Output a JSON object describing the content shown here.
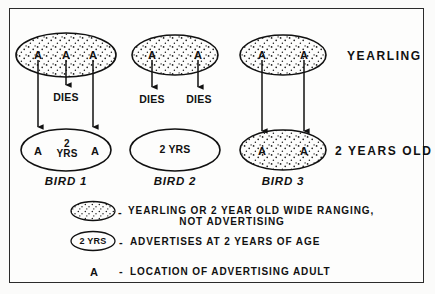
{
  "figure": {
    "row_labels": {
      "top": "YEARLING",
      "bottom": "2 YEARS OLD"
    },
    "birds": [
      {
        "caption": "BIRD 1",
        "top": {
          "stippled": true,
          "markers": [
            "A",
            "A",
            "A"
          ]
        },
        "bottom": {
          "stippled": false,
          "left_marker": "A",
          "center_line1": "2",
          "center_line2": "YRS",
          "right_marker": "A"
        },
        "dies_labels": [
          "DIES"
        ]
      },
      {
        "caption": "BIRD 2",
        "top": {
          "stippled": true,
          "markers": [
            "A",
            "A"
          ]
        },
        "bottom": {
          "stippled": false,
          "center_text": "2 YRS"
        },
        "dies_labels": [
          "DIES",
          "DIES"
        ]
      },
      {
        "caption": "BIRD 3",
        "top": {
          "stippled": true,
          "markers": [
            "A",
            "A"
          ]
        },
        "bottom": {
          "stippled": true,
          "markers": [
            "A",
            "A"
          ]
        },
        "dies_labels": []
      }
    ],
    "legend": [
      {
        "key_type": "stippled-ellipse",
        "dash": "-",
        "line1": "YEARLING OR 2 YEAR OLD  WIDE  RANGING,",
        "line2": "NOT  ADVERTISING"
      },
      {
        "key_type": "plain-ellipse",
        "key_text": "2 YRS",
        "dash": "-",
        "line1": "ADVERTISES  AT  2  YEARS  OF  AGE"
      },
      {
        "key_type": "letter",
        "key_text": "A",
        "dash": "-",
        "line1": "LOCATION  OF  ADVERTISING  ADULT"
      }
    ]
  },
  "colors": {
    "ink": "#111111",
    "frame": "#2b2b2b",
    "paper": "#fdfdfc"
  }
}
